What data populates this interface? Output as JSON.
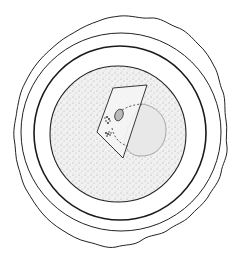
{
  "figure": {
    "description": "Pen-and-ink stippled illustration of an egg cell with concentric envelopes",
    "colors": {
      "background": "#ffffff",
      "ink": "#222222",
      "stipple": "#555555",
      "cell_fill": "#ececec",
      "nucleus_fill": "#e4e4e4"
    },
    "parts": [
      {
        "name": "outer-wavy-envelope"
      },
      {
        "name": "middle-envelope-ring"
      },
      {
        "name": "inner-envelope-ring"
      },
      {
        "name": "stippled-cell-body"
      },
      {
        "name": "pale-nucleus-region"
      },
      {
        "name": "inset-plane-quadrilateral"
      },
      {
        "name": "small-oval-body"
      },
      {
        "name": "chromosome-clusters"
      }
    ]
  }
}
